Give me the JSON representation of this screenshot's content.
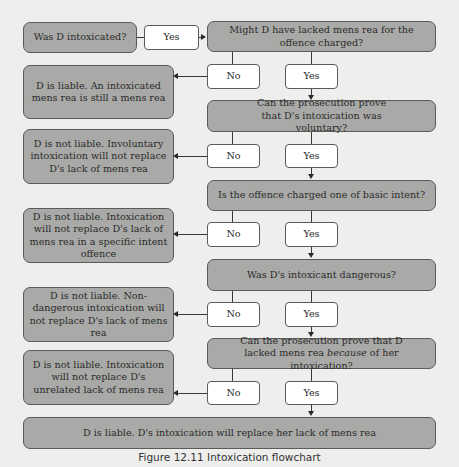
{
  "diagram": {
    "start": "Was D intoxicated?",
    "start_yes": "Yes",
    "questions": [
      {
        "text": "Might D have lacked mens rea for the offence charged?",
        "no": "No",
        "yes": "Yes",
        "no_outcome": "D is liable. An intoxicated mens rea is still a mens rea"
      },
      {
        "text": "Can the prosecution prove that D's intoxication was voluntary?",
        "no": "No",
        "yes": "Yes",
        "no_outcome": "D is not liable. Involuntary intoxication will not replace D's lack of mens rea"
      },
      {
        "text": "Is the offence charged one of basic intent?",
        "no": "No",
        "yes": "Yes",
        "no_outcome": "D is not liable. Intoxication will not replace D's lack of mens rea in a specific intent offence"
      },
      {
        "text": "Was D's intoxicant dangerous?",
        "no": "No",
        "yes": "Yes",
        "no_outcome": "D is not liable. Non-dangerous intoxication will not replace D's lack of mens rea"
      },
      {
        "text_before": "Can the prosecution prove that D lacked mens rea ",
        "text_italic": "because",
        "text_after": " of her intoxication?",
        "no": "No",
        "yes": "Yes",
        "no_outcome": "D is not liable. Intoxication will not replace D's unrelated lack of mens rea"
      }
    ],
    "final": "D is liable. D's intoxication will replace her lack of mens rea"
  },
  "caption": "Figure 12.11 Intoxication flowchart",
  "colors": {
    "background": "#eeeeec",
    "grey_box": "#a9a9a7",
    "white_box": "#ffffff",
    "border": "#5a5a5a"
  }
}
